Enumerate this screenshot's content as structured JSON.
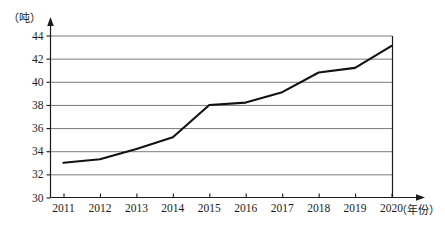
{
  "chart_data": {
    "type": "line",
    "title": "",
    "xlabel": "（年份）",
    "ylabel": "（吨）",
    "categories": [
      "2011",
      "2012",
      "2013",
      "2014",
      "2015",
      "2016",
      "2017",
      "2018",
      "2019",
      "2020"
    ],
    "values": [
      33.0,
      33.3,
      34.2,
      35.2,
      38.0,
      38.2,
      39.1,
      40.8,
      41.2,
      43.1
    ],
    "series": [
      {
        "name": "",
        "values": [
          33.0,
          33.3,
          34.2,
          35.2,
          38.0,
          38.2,
          39.1,
          40.8,
          41.2,
          43.1
        ]
      }
    ],
    "ylim": [
      30,
      44
    ],
    "yticks": [
      30,
      32,
      34,
      36,
      38,
      40,
      42,
      44
    ],
    "ytick_labels": [
      "30",
      "32",
      "34",
      "36",
      "38",
      "40",
      "42",
      "44"
    ],
    "xticks": [
      "2011",
      "2012",
      "2013",
      "2014",
      "2015",
      "2016",
      "2017",
      "2018",
      "2019",
      "2020"
    ],
    "grid": true,
    "grid_axis": "y",
    "legend": "none",
    "line_color": "#111111",
    "grid_color": "#7a7a7a",
    "axis_color": "#1b1b1b",
    "background_color": "#ffffff"
  },
  "axis": {
    "y_unit": "（吨）",
    "x_unit": "（年份）"
  }
}
